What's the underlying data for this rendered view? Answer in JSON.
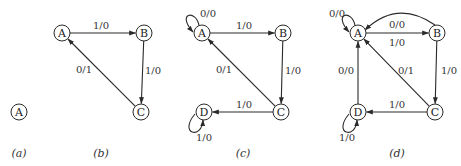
{
  "diagram": {
    "type": "state-transition-diagrams",
    "node_radius": 8,
    "panels": [
      {
        "caption": "(a)",
        "caption_pos": [
          19,
          153
        ],
        "nodes": [
          {
            "id": "A",
            "label": "A",
            "x": 19,
            "y": 112
          }
        ],
        "edges": []
      },
      {
        "caption": "(b)",
        "caption_pos": [
          101,
          153
        ],
        "nodes": [
          {
            "id": "A",
            "label": "A",
            "x": 62,
            "y": 33
          },
          {
            "id": "B",
            "label": "B",
            "x": 144,
            "y": 33
          },
          {
            "id": "C",
            "label": "C",
            "x": 141,
            "y": 112
          }
        ],
        "edges": [
          {
            "from": "A",
            "to": "B",
            "label": "1/0",
            "lx": 101,
            "ly": 25
          },
          {
            "from": "B",
            "to": "C",
            "label": "1/0",
            "lx": 153,
            "ly": 70
          },
          {
            "from": "C",
            "to": "A",
            "label": "0/1",
            "lx": 84,
            "ly": 69
          }
        ]
      },
      {
        "caption": "(c)",
        "caption_pos": [
          243,
          153
        ],
        "nodes": [
          {
            "id": "A",
            "label": "A",
            "x": 202,
            "y": 33
          },
          {
            "id": "B",
            "label": "B",
            "x": 283,
            "y": 33
          },
          {
            "id": "C",
            "label": "C",
            "x": 281,
            "y": 112
          },
          {
            "id": "D",
            "label": "D",
            "x": 204,
            "y": 112
          }
        ],
        "edges": [
          {
            "from": "A",
            "to": "A",
            "label": "0/0",
            "loop": "upper-left",
            "lx": 208,
            "ly": 13
          },
          {
            "from": "A",
            "to": "B",
            "label": "1/0",
            "lx": 244,
            "ly": 25
          },
          {
            "from": "B",
            "to": "C",
            "label": "1/0",
            "lx": 293,
            "ly": 70
          },
          {
            "from": "C",
            "to": "A",
            "label": "0/1",
            "lx": 224,
            "ly": 69
          },
          {
            "from": "C",
            "to": "D",
            "label": "1/0",
            "lx": 244,
            "ly": 104
          },
          {
            "from": "D",
            "to": "D",
            "label": "1/0",
            "loop": "lower-left",
            "lx": 204,
            "ly": 137
          }
        ]
      },
      {
        "caption": "(d)",
        "caption_pos": [
          397,
          153
        ],
        "nodes": [
          {
            "id": "A",
            "label": "A",
            "x": 358,
            "y": 33
          },
          {
            "id": "B",
            "label": "B",
            "x": 437,
            "y": 33
          },
          {
            "id": "C",
            "label": "C",
            "x": 435,
            "y": 112
          },
          {
            "id": "D",
            "label": "D",
            "x": 358,
            "y": 112
          }
        ],
        "edges": [
          {
            "from": "A",
            "to": "A",
            "label": "0/0",
            "loop": "upper-left",
            "lx": 337,
            "ly": 13
          },
          {
            "from": "B",
            "to": "A",
            "label": "0/0",
            "curved": true,
            "lx": 397,
            "ly": 24
          },
          {
            "from": "A",
            "to": "B",
            "label": "1/0",
            "lx": 397,
            "ly": 42
          },
          {
            "from": "B",
            "to": "C",
            "label": "1/0",
            "lx": 449,
            "ly": 70
          },
          {
            "from": "C",
            "to": "A",
            "label": "0/1",
            "lx": 406,
            "ly": 70
          },
          {
            "from": "D",
            "to": "A",
            "label": "0/0",
            "lx": 346,
            "ly": 70
          },
          {
            "from": "C",
            "to": "D",
            "label": "1/0",
            "lx": 397,
            "ly": 104
          },
          {
            "from": "D",
            "to": "D",
            "label": "1/0",
            "loop": "lower-left",
            "lx": 347,
            "ly": 137
          }
        ]
      }
    ]
  }
}
